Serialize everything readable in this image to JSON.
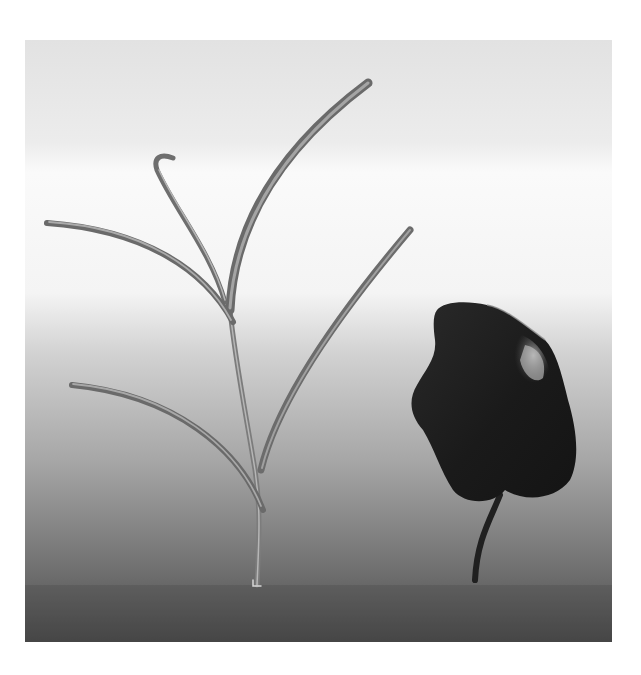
{
  "image": {
    "description": "Grayscale photo of a young grass-like seedling beside a dark rounded leaf on a short stem, against a gradient backdrop",
    "background": {
      "top_color": "#e4e4e4",
      "highlight_color": "#fafafa",
      "mid_color": "#b8b8b8",
      "bottom_color": "#484848"
    },
    "subjects": [
      {
        "name": "grass-seedling",
        "tone": "#6a6a6a",
        "highlight": "#a8a8a8"
      },
      {
        "name": "dark-leaf",
        "tone": "#1e1e1e",
        "highlight": "#8c8c8c"
      }
    ]
  }
}
